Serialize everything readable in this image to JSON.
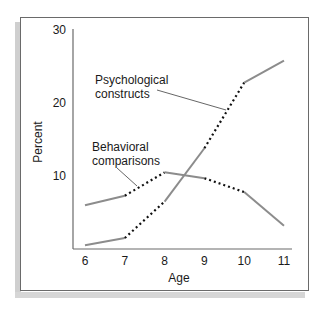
{
  "chart_data": {
    "type": "line",
    "title": "",
    "xlabel": "Age",
    "ylabel": "Percent",
    "x": [
      6,
      7,
      8,
      9,
      10,
      11
    ],
    "x_tick_labels": [
      "6",
      "7",
      "8",
      "9",
      "10",
      "11"
    ],
    "y_tick_labels": [
      "10",
      "20",
      "30"
    ],
    "ylim": [
      0,
      30
    ],
    "xlim": [
      5.7,
      11.3
    ],
    "grid": false,
    "legend": "inline labels with leader lines",
    "series": [
      {
        "name": "Psychological constructs",
        "values": [
          0.5,
          1.5,
          6.5,
          13.8,
          22.8,
          25.8
        ],
        "segment_styles": [
          "solid",
          "dotted",
          "solid",
          "dotted",
          "solid"
        ]
      },
      {
        "name": "Behavioral comparisons",
        "values": [
          6.0,
          7.3,
          10.5,
          9.7,
          7.8,
          3.2
        ],
        "segment_styles": [
          "solid",
          "dotted",
          "solid",
          "dotted",
          "solid"
        ]
      }
    ],
    "labels": {
      "psych_line1": "Psychological",
      "psych_line2": "constructs",
      "behav_line1": "Behavioral",
      "behav_line2": "comparisons"
    },
    "colors": {
      "solid": "#8c8c8c",
      "dotted": "#111111",
      "axis": "#6a6a6a",
      "frame": "#6a6a6a",
      "shadow": "#cfcfcf"
    }
  }
}
